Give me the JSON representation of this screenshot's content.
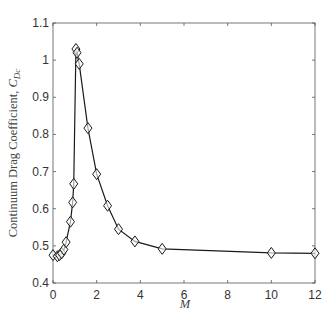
{
  "chart_data": {
    "type": "line",
    "title": "",
    "xlabel": "M",
    "ylabel": "Continuum Drag Coefficient, ",
    "ylabel_symbol": "C",
    "ylabel_subscript": "Dc",
    "xlim": [
      0,
      12
    ],
    "ylim": [
      0.4,
      1.1
    ],
    "xticks": [
      0,
      2,
      4,
      6,
      8,
      10,
      12
    ],
    "yticks": [
      0.4,
      0.5,
      0.6,
      0.7,
      0.8,
      0.9,
      1.0,
      1.1
    ],
    "xtick_labels": [
      "0",
      "2",
      "4",
      "6",
      "8",
      "10",
      "12"
    ],
    "ytick_labels": [
      "0.4",
      "0.5",
      "0.6",
      "0.7",
      "0.8",
      "0.9",
      "1",
      "1.1"
    ],
    "grid": false,
    "legend": null,
    "marker": "diamond",
    "series": [
      {
        "name": "C_Dc",
        "x": [
          0.0,
          0.2,
          0.3,
          0.4,
          0.5,
          0.6,
          0.8,
          0.9,
          0.95,
          1.05,
          1.1,
          1.2,
          1.6,
          2.0,
          2.5,
          3.0,
          3.75,
          5.0,
          10.0,
          12.0
        ],
        "y": [
          0.475,
          0.472,
          0.475,
          0.48,
          0.49,
          0.51,
          0.565,
          0.617,
          0.667,
          1.03,
          1.02,
          0.99,
          0.817,
          0.693,
          0.608,
          0.545,
          0.512,
          0.492,
          0.481,
          0.48
        ]
      }
    ]
  },
  "colors": {
    "line": "#1a1a1a",
    "axis": "#555555",
    "text": "#333333"
  }
}
